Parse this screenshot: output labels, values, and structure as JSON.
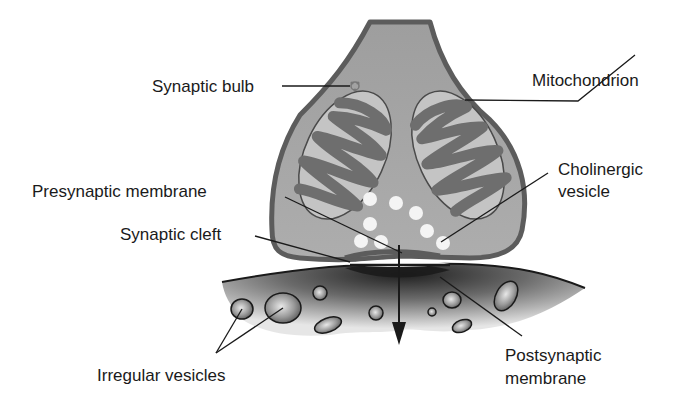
{
  "diagram": {
    "colors": {
      "background": "#ffffff",
      "bulb_fill": "#a6a6a6",
      "bulb_outline": "#5c5c5c",
      "mitochondrion_outer": "#c4c4c4",
      "mitochondrion_cristae": "#6e6e6e",
      "vesicle": "#f2f2f2",
      "postsynaptic_dark": "#2e2e2e",
      "postsynaptic_light": "#e0e0e0",
      "text": "#1a1a1a"
    },
    "labels": {
      "synaptic_bulb": "Synaptic bulb",
      "mitochondrion": "Mitochondrion",
      "cholinergic_vesicle_line1": "Cholinergic",
      "cholinergic_vesicle_line2": "vesicle",
      "presynaptic_membrane": "Presynaptic membrane",
      "synaptic_cleft": "Synaptic cleft",
      "postsynaptic_membrane_line1": "Postsynaptic",
      "postsynaptic_membrane_line2": "membrane",
      "irregular_vesicles": "Irregular vesicles"
    }
  }
}
